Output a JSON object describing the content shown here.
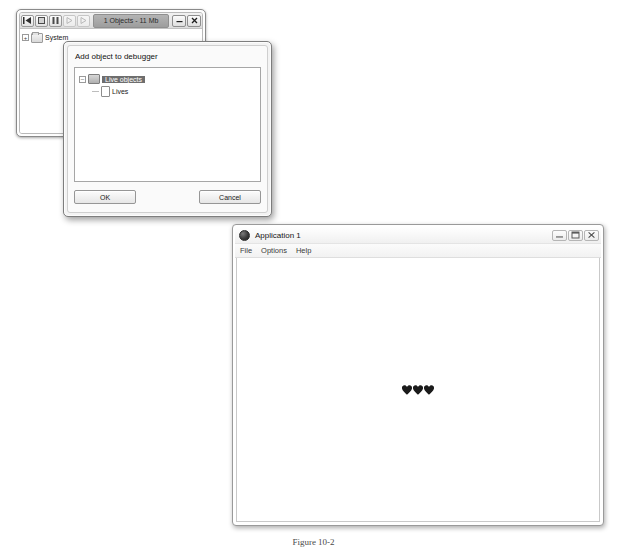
{
  "debugger_window": {
    "title": "1 Objects - 11 Mb",
    "toolbar": [
      {
        "name": "skip-back-button",
        "glyph": "|◄",
        "disabled": false
      },
      {
        "name": "stop-button",
        "glyph": "■",
        "disabled": false
      },
      {
        "name": "pause-button",
        "glyph": "‖",
        "disabled": false
      },
      {
        "name": "step-button",
        "glyph": "▷",
        "disabled": true
      },
      {
        "name": "play-button",
        "glyph": "▷",
        "disabled": true
      }
    ],
    "controls": {
      "minimize": "–",
      "close": "✕"
    },
    "tree": [
      {
        "label": "System",
        "expander": "+",
        "icon": "folder-icon"
      }
    ]
  },
  "add_object_dialog": {
    "title": "Add object to debugger",
    "tree": [
      {
        "label": "Live objects",
        "expander": "–",
        "icon": "object-icon",
        "selected": true
      },
      {
        "label": "Lives",
        "expander": "",
        "icon": "document-icon",
        "selected": false
      }
    ],
    "ok_label": "OK",
    "cancel_label": "Cancel"
  },
  "application_window": {
    "title": "Application 1",
    "menu": [
      "File",
      "Options",
      "Help"
    ],
    "controls": {
      "minimize": "minimize-icon",
      "maximize": "maximize-icon",
      "close": "close-icon"
    },
    "canvas": {
      "lives_count": 3,
      "life_symbol": "♥",
      "life_color": "#1b1b1b"
    }
  },
  "figure_caption": {
    "text": "Figure 10-2"
  }
}
